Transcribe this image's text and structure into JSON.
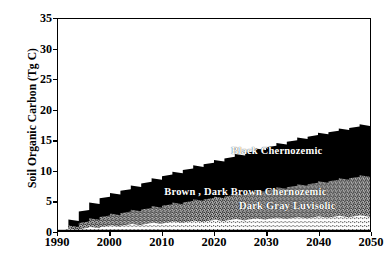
{
  "chart_data": {
    "type": "area",
    "title": "",
    "subtitle": "",
    "xlabel": "",
    "ylabel": "Soil Organic Carbon (Tg C)",
    "xlim": [
      1990,
      2050
    ],
    "ylim": [
      0,
      35
    ],
    "grid": false,
    "legend_position": "inline-on-areas",
    "stacked": true,
    "xticks": [
      "1990",
      "2000",
      "2010",
      "2020",
      "2030",
      "2040",
      "2050"
    ],
    "xtick_values": [
      1990,
      2000,
      2010,
      2020,
      2030,
      2040,
      2050
    ],
    "yticks": [
      "0",
      "5",
      "10",
      "15",
      "20",
      "25",
      "30",
      "35"
    ],
    "ytick_values": [
      0,
      5,
      10,
      15,
      20,
      25,
      30,
      35
    ],
    "x": [
      1990,
      1992,
      1994,
      1996,
      1998,
      2000,
      2002,
      2004,
      2006,
      2008,
      2010,
      2012,
      2014,
      2016,
      2018,
      2020,
      2022,
      2024,
      2026,
      2028,
      2030,
      2032,
      2034,
      2036,
      2038,
      2040,
      2042,
      2044,
      2046,
      2048,
      2050
    ],
    "series": [
      {
        "name": "Dark Gray Luvisolic",
        "fill": "#d9d9d9",
        "values": [
          0,
          0.15,
          0.3,
          0.45,
          0.6,
          0.72,
          0.85,
          0.95,
          1.05,
          1.15,
          1.25,
          1.33,
          1.4,
          1.48,
          1.55,
          1.62,
          1.68,
          1.75,
          1.8,
          1.86,
          1.92,
          1.97,
          2.02,
          2.07,
          2.12,
          2.17,
          2.21,
          2.26,
          2.3,
          2.35,
          2.4
        ]
      },
      {
        "name": "Brown , Dark Brown Chernozemic",
        "fill": "#8c8c8c",
        "values": [
          0,
          0.5,
          1.0,
          1.4,
          1.7,
          1.9,
          2.1,
          2.3,
          2.5,
          2.7,
          2.9,
          3.1,
          3.3,
          3.5,
          3.65,
          3.8,
          4.0,
          4.2,
          4.4,
          4.6,
          4.8,
          5.0,
          5.2,
          5.4,
          5.6,
          5.8,
          6.0,
          6.2,
          6.4,
          6.6,
          6.8
        ]
      },
      {
        "name": "Black Chernozemic",
        "fill": "#000000",
        "values": [
          0,
          1.0,
          1.9,
          2.6,
          3.1,
          3.4,
          3.7,
          4.0,
          4.3,
          4.6,
          4.9,
          5.1,
          5.35,
          5.6,
          5.8,
          6.05,
          6.3,
          6.5,
          6.7,
          6.9,
          7.1,
          7.3,
          7.5,
          7.7,
          7.85,
          8.0,
          8.1,
          8.2,
          8.3,
          8.4,
          8.5
        ]
      }
    ],
    "cumulative_tops": {
      "Dark Gray Luvisolic": [
        0,
        0.15,
        0.3,
        0.45,
        0.6,
        0.72,
        0.85,
        0.95,
        1.05,
        1.15,
        1.25,
        1.33,
        1.4,
        1.48,
        1.55,
        1.62,
        1.68,
        1.75,
        1.8,
        1.86,
        1.92,
        1.97,
        2.02,
        2.07,
        2.12,
        2.17,
        2.21,
        2.26,
        2.3,
        2.35,
        2.4
      ],
      "Brown , Dark Brown Chernozemic": [
        0,
        0.65,
        1.3,
        1.85,
        2.3,
        2.62,
        2.95,
        3.25,
        3.55,
        3.85,
        4.15,
        4.43,
        4.7,
        4.98,
        5.2,
        5.42,
        5.68,
        5.95,
        6.2,
        6.46,
        6.72,
        6.97,
        7.22,
        7.47,
        7.72,
        7.97,
        8.21,
        8.46,
        8.7,
        8.95,
        9.2
      ],
      "Black Chernozemic": [
        0,
        1.65,
        3.2,
        4.45,
        5.4,
        6.02,
        6.65,
        7.25,
        7.85,
        8.45,
        9.05,
        9.53,
        10.05,
        10.58,
        11.0,
        11.47,
        11.98,
        12.45,
        12.9,
        13.36,
        13.82,
        14.27,
        14.72,
        15.17,
        15.57,
        15.97,
        16.31,
        16.66,
        17.0,
        17.35,
        17.7
      ]
    },
    "annotations": [
      {
        "text": "Black Chernozemic",
        "x": 2032,
        "y": 13.2
      },
      {
        "text": "Brown , Dark Brown Chernozemic",
        "x": 2026,
        "y": 6.5
      },
      {
        "text": "Dark Gray Luvisolic",
        "x": 2034,
        "y": 4.3
      }
    ]
  },
  "axis": {
    "y_title": "Soil Organic Carbon (Tg C)"
  }
}
